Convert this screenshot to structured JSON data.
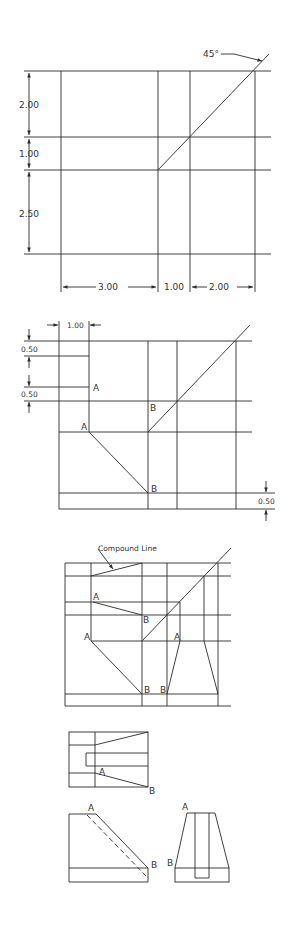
{
  "figure1": {
    "angle_label": "45°",
    "dims_vertical": [
      "2.00",
      "1.00",
      "2.50"
    ],
    "dims_horizontal": [
      "3.00",
      "1.00",
      "2.00"
    ]
  },
  "figure2": {
    "dim_top": "1.00",
    "dims_left": [
      "0.50",
      "0.50"
    ],
    "dim_right": "0.50",
    "point_labels": {
      "a_upper": "A",
      "a_lower": "A",
      "b_upper": "B",
      "b_lower": "B"
    }
  },
  "figure3": {
    "callout": "Compound Line",
    "point_labels": {
      "a1": "A",
      "b1": "B",
      "a2": "A",
      "b2": "B",
      "a3": "A",
      "b3": "B",
      "b4": "B"
    }
  },
  "figure4": {
    "point_labels": {
      "a": "A",
      "b": "B"
    }
  },
  "figure5": {
    "point_labels": {
      "a": "A",
      "b": "B"
    }
  },
  "figure6": {
    "point_labels": {
      "a": "A",
      "b": "B"
    }
  },
  "colors": {
    "line": "#2a2a2a",
    "background": "#ffffff",
    "text": "#333333"
  }
}
